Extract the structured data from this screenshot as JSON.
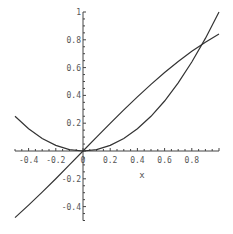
{
  "chart_data": {
    "type": "line",
    "title": "",
    "xlabel": "x",
    "ylabel": "",
    "xlim": [
      -0.5,
      1
    ],
    "ylim": [
      -0.5,
      1
    ],
    "grid": false,
    "legend": null,
    "x_ticks": [
      "-0.4",
      "-0.2",
      "0",
      "0.2",
      "0.4",
      "0.6",
      "0.8"
    ],
    "y_ticks": [
      "-0.4",
      "-0.2",
      "0.2",
      "0.4",
      "0.6",
      "0.8",
      "1"
    ],
    "series": [
      {
        "name": "x^2",
        "x": [
          -0.5,
          -0.4,
          -0.3,
          -0.2,
          -0.1,
          0,
          0.1,
          0.2,
          0.3,
          0.4,
          0.5,
          0.6,
          0.7,
          0.8,
          0.9,
          1.0
        ],
        "values": [
          0.25,
          0.16,
          0.09,
          0.04,
          0.01,
          0,
          0.01,
          0.04,
          0.09,
          0.16,
          0.25,
          0.36,
          0.49,
          0.64,
          0.81,
          1.0
        ]
      },
      {
        "name": "sin(x)",
        "x": [
          -0.5,
          -0.4,
          -0.3,
          -0.2,
          -0.1,
          0,
          0.1,
          0.2,
          0.3,
          0.4,
          0.5,
          0.6,
          0.7,
          0.8,
          0.9,
          1.0
        ],
        "values": [
          -0.479,
          -0.389,
          -0.296,
          -0.199,
          -0.1,
          0,
          0.1,
          0.199,
          0.296,
          0.389,
          0.479,
          0.565,
          0.644,
          0.717,
          0.783,
          0.841
        ]
      }
    ],
    "annotations": [
      {
        "text": "intersection",
        "x": 0.877,
        "y": 0.769
      }
    ]
  },
  "colors": {
    "curve": "#333333",
    "axis": "#444444",
    "background": "#ffffff"
  }
}
